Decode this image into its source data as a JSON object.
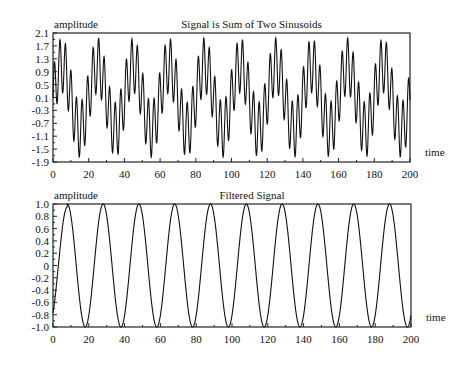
{
  "chart_data": [
    {
      "type": "line",
      "title": "Signal is Sum of Two Sinusoids",
      "xlabel": "time",
      "ylabel": "amplitude",
      "xlim": [
        0,
        200
      ],
      "ylim": [
        -1.9,
        2.1
      ],
      "xticks": [
        "0",
        "20",
        "40",
        "60",
        "80",
        "100",
        "120",
        "140",
        "160",
        "180",
        "200"
      ],
      "yticks": [
        "2.1",
        "1.7",
        "1.3",
        "0.9",
        "0.5",
        "0.1",
        "-0.3",
        "-0.7",
        "-1.1",
        "-1.5",
        "-1.9"
      ],
      "grid": false,
      "series": [
        {
          "name": "sum of two sinusoids",
          "formula": "sin(2*pi*t/20) + sin(2*pi*t/3)",
          "slow_period": 20,
          "fast_period": 3,
          "x_range": [
            0,
            200
          ]
        }
      ]
    },
    {
      "type": "line",
      "title": "Filtered Signal",
      "xlabel": "time",
      "ylabel": "amplitude",
      "xlim": [
        0,
        200
      ],
      "ylim": [
        -1.0,
        1.0
      ],
      "xticks": [
        "0",
        "20",
        "40",
        "60",
        "80",
        "100",
        "120",
        "140",
        "160",
        "180",
        "200"
      ],
      "yticks": [
        "1.0",
        "0.8",
        "0.6",
        "0.4",
        "0.2",
        "0",
        "-0.2",
        "-0.4",
        "-0.6",
        "-0.8",
        "-1.0"
      ],
      "grid": false,
      "series": [
        {
          "name": "filtered signal",
          "formula": "sin(2*pi*(t-3)/20)",
          "period": 20,
          "peaks_at": [
            8,
            28,
            48,
            68,
            88,
            108,
            128,
            148,
            168,
            188
          ],
          "troughs_at": [
            18,
            38,
            58,
            78,
            98,
            118,
            138,
            158,
            178,
            198
          ]
        }
      ]
    }
  ],
  "top": {
    "title": "Signal is Sum of Two Sinusoids",
    "ylabel": "amplitude",
    "xlabel": "time"
  },
  "bottom": {
    "title": "Filtered Signal",
    "ylabel": "amplitude",
    "xlabel": "time"
  }
}
